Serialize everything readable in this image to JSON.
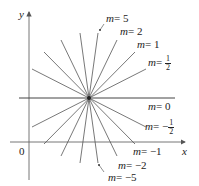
{
  "diagram": {
    "type": "family of lines through a point",
    "axes": {
      "x_label": "x",
      "y_label": "y",
      "origin_label": "0"
    },
    "center": {
      "px": [
        89,
        98
      ]
    },
    "lines": [
      {
        "slope": "5",
        "label_text": "= 5",
        "labeled": true
      },
      {
        "slope": "2",
        "label_text": "= 2",
        "labeled": true
      },
      {
        "slope": "1",
        "label_text": "= 1",
        "labeled": true
      },
      {
        "slope": "1/2",
        "label_text": "= ",
        "frac_num": "1",
        "frac_den": "2",
        "labeled": true
      },
      {
        "slope": "0",
        "label_text": "= 0",
        "labeled": true
      },
      {
        "slope": "-1/2",
        "label_text": "= −",
        "frac_num": "1",
        "frac_den": "2",
        "labeled": true
      },
      {
        "slope": "-1",
        "label_text": "= −1",
        "labeled": true
      },
      {
        "slope": "-2",
        "label_text": "= −2",
        "labeled": true
      },
      {
        "slope": "-5",
        "label_text": "= −5",
        "labeled": true
      }
    ],
    "var": "m",
    "colors": {
      "line": "#555555",
      "axis": "#666666",
      "text": "#222222"
    }
  }
}
